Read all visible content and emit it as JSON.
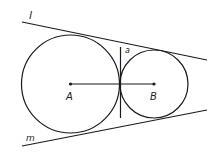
{
  "diagram": {
    "labels": {
      "line_l": "l",
      "line_m": "m",
      "line_a": "a",
      "center_a": "A",
      "center_b": "B"
    },
    "circles": [
      {
        "name": "A",
        "cx": 70.5,
        "cy": 84,
        "r": 49
      },
      {
        "name": "B",
        "cx": 154,
        "cy": 84,
        "r": 34
      }
    ],
    "stroke_color": "#1a1a1a"
  }
}
